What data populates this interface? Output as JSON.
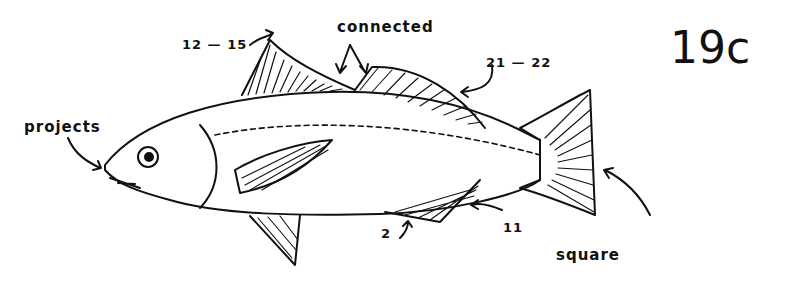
{
  "figure": {
    "number": "19c"
  },
  "labels": {
    "dorsal_spines": "12 — 15",
    "connected": "connected",
    "dorsal_rays": "21 — 22",
    "snout": "projects",
    "anal_spines": "2",
    "anal_rays": "11",
    "tail": "square"
  },
  "colors": {
    "ink": "#111111",
    "paper": "#ffffff"
  }
}
